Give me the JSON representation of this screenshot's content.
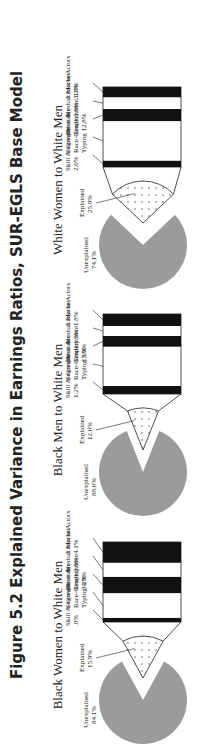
{
  "title": "Figure 5.2  Explained Variance in Earnings Ratios, SUR-EGLS Base Model",
  "chart_data": [
    {
      "type": "pie",
      "title": "Black Women to White Men",
      "slices": [
        {
          "label": "Unexplained",
          "value": 84.1
        },
        {
          "label": "Explained",
          "value": 15.9
        }
      ],
      "explained_breakdown": [
        {
          "label": "Skill & Growth",
          "value": 0.8,
          "display": ".8%"
        },
        {
          "label": "Segregation & Race-Gender Typing",
          "value": 4.9,
          "display": "4.9%"
        },
        {
          "label": "Desirable Employment",
          "value": 3.2,
          "display": "3.2%"
        },
        {
          "label": "Product Market",
          "value": 2.8,
          "display": "2.8%"
        },
        {
          "label": "Links to Actors",
          "value": 4.1,
          "display": "4.1%"
        }
      ]
    },
    {
      "type": "pie",
      "title": "Black Men to White Men",
      "slices": [
        {
          "label": "Unexplained",
          "value": 88.0
        },
        {
          "label": "Explained",
          "value": 12.0
        }
      ],
      "explained_breakdown": [
        {
          "label": "Skill & Growth",
          "value": 1.2,
          "display": "1.2%"
        },
        {
          "label": "Segregation & Race-Gender Typing",
          "value": 5.9,
          "display": "5.9%"
        },
        {
          "label": "Desirable Employment",
          "value": 1.6,
          "display": "1.6%"
        },
        {
          "label": "Product Market",
          "value": 1.5,
          "display": "1.5%"
        },
        {
          "label": "Links to Actors",
          "value": 1.8,
          "display": "1.8%"
        }
      ]
    },
    {
      "type": "pie",
      "title": "White Women to White Men",
      "slices": [
        {
          "label": "Unexplained",
          "value": 74.1
        },
        {
          "label": "Explained",
          "value": 25.9
        }
      ],
      "explained_breakdown": [
        {
          "label": "Skill & Growth",
          "value": 2.0,
          "display": "2.0%"
        },
        {
          "label": "Segregation & Race-Gender Typing",
          "value": 12.8,
          "display": "12.8%"
        },
        {
          "label": "Desirable Employment",
          "value": 3.9,
          "display": "3.9%"
        },
        {
          "label": "Product Market",
          "value": 3.8,
          "display": "3.8%"
        },
        {
          "label": "Links to Actors",
          "value": 3.3,
          "display": "3.3%"
        }
      ]
    }
  ],
  "labels": {
    "bw": {
      "unexp": "Unexplained",
      "unexp_v": "84.1%",
      "exp": "Explained",
      "exp_v": "15.9%",
      "l1a": "Skill & Growth",
      "l1b": ".8%",
      "l2a": "Segregation &",
      "l2b": "Race-Gender",
      "l2c": "Typing  4.9%",
      "l3a": "Desirable",
      "l3b": "Employment",
      "l3c": "3.2%",
      "l4a": "Product Market",
      "l4b": "2.8%",
      "l5a": "Links to Actors",
      "l5b": "4.1%"
    },
    "bm": {
      "unexp": "Unexplained",
      "unexp_v": "88.0%",
      "exp": "Explained",
      "exp_v": "12.0%",
      "l1a": "Skill & Growth",
      "l1b": "1.2%",
      "l2a": "Segregation &",
      "l2b": "Race-Gender",
      "l2c": "Typing  5.9%",
      "l3a": "Desirable",
      "l3b": "Employment",
      "l3c": "1.6%",
      "l4a": "Product Market",
      "l4b": "1.5%",
      "l5a": "Links to Actors",
      "l5b": "1.8%"
    },
    "ww": {
      "unexp": "Unexplained",
      "unexp_v": "74.1%",
      "exp": "Explained",
      "exp_v": "25.9%",
      "l1a": "Skill & Growth",
      "l1b": "2.0%",
      "l2a": "Segregation &",
      "l2b": "Race-Gender",
      "l2c": "Typing  12.8%",
      "l3a": "Desirable",
      "l3b": "Employment  3.9%",
      "l3c": "",
      "l4a": "Product Market",
      "l4b": "3.8%",
      "l5a": "Links to Actors",
      "l5b": "3.3%"
    }
  }
}
